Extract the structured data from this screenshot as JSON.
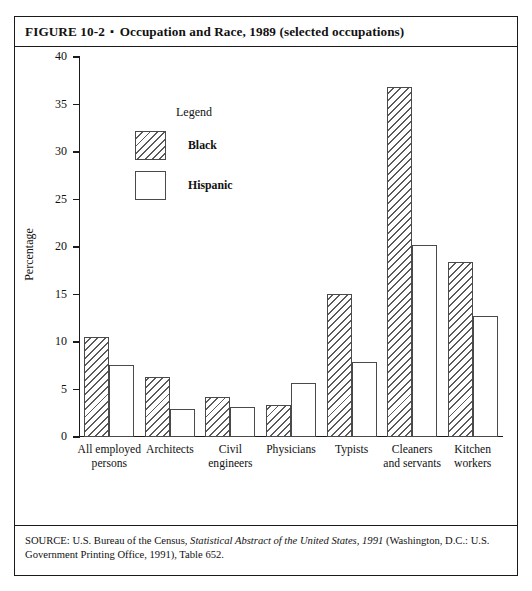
{
  "figure": {
    "label": "FIGURE 10-2",
    "separator": "▪",
    "title": "Occupation and Race, 1989 (selected occupations)",
    "full_title": "FIGURE 10-2 ▪ Occupation and Race, 1989 (selected occupations)"
  },
  "source": {
    "prefix": "SOURCE: U.S. Bureau of the Census,",
    "italic": "Statistical Abstract of the United States, 1991",
    "suffix": "(Washington, D.C.: U.S. Government Printing Office, 1991), Table 652."
  },
  "legend": {
    "title": "Legend",
    "entries": [
      {
        "label": "Black",
        "pattern": "diagonal-hatch",
        "color": "#5b5b5b"
      },
      {
        "label": "Hispanic",
        "pattern": "solid-white",
        "color": "#ffffff"
      }
    ]
  },
  "chart_data": {
    "type": "bar",
    "title": "Occupation and Race, 1989 (selected occupations)",
    "xlabel": "",
    "ylabel": "Percentage",
    "ylim": [
      0,
      40
    ],
    "yticks": [
      0,
      5,
      10,
      15,
      20,
      25,
      30,
      35,
      40
    ],
    "ytick_labels": [
      "0",
      "5",
      "10",
      "15",
      "20",
      "25",
      "30",
      "35",
      "40"
    ],
    "grid": false,
    "legend_position": "inside-upper-left",
    "categories": [
      "All employed persons",
      "Architects",
      "Civil engineers",
      "Physicians",
      "Typists",
      "Cleaners and servants",
      "Kitchen workers"
    ],
    "category_lines": [
      [
        "All employed",
        "persons"
      ],
      [
        "Architects"
      ],
      [
        "Civil",
        "engineers"
      ],
      [
        "Physicians"
      ],
      [
        "Typists"
      ],
      [
        "Cleaners",
        "and servants"
      ],
      [
        "Kitchen",
        "workers"
      ]
    ],
    "series": [
      {
        "name": "Black",
        "values": [
          10.5,
          6.3,
          4.2,
          3.4,
          15.1,
          36.8,
          18.4
        ]
      },
      {
        "name": "Hispanic",
        "values": [
          7.6,
          3.0,
          3.2,
          5.7,
          7.9,
          20.2,
          12.7
        ]
      }
    ]
  }
}
